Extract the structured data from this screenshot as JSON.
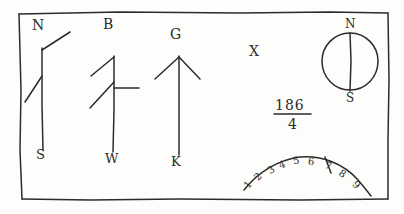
{
  "figure": {
    "ink_color": "#2b2b2b",
    "paper_color": "#fdfdfb",
    "border": {
      "name": "hand-drawn-rectangle-frame",
      "present": true
    }
  },
  "symbols": [
    {
      "id": "symbol-n-s",
      "top_label": "N",
      "bottom_label": "S",
      "shape": "vertical-stem-with-upper-right-barb-and-lower-left-barb"
    },
    {
      "id": "symbol-b-w",
      "top_label": "B",
      "bottom_label": "W",
      "shape": "vertical-stem-with-two-left-barbs-and-right-crossbar"
    },
    {
      "id": "symbol-g-k",
      "top_label": "G",
      "bottom_label": "K",
      "shape": "upward-arrow-with-two-barbs"
    }
  ],
  "marks": {
    "x_mark": "X"
  },
  "compass": {
    "name": "circle-with-vertical-diameter",
    "north_label": "N",
    "south_label": "S"
  },
  "fraction": {
    "numerator": "186",
    "denominator": "4"
  },
  "scale_arc": {
    "name": "numbered-arc-scale",
    "digits": [
      "1",
      "2",
      "3",
      "4",
      "5",
      "6",
      "7",
      "8",
      "9"
    ],
    "pointer_between": [
      "6",
      "7"
    ]
  }
}
